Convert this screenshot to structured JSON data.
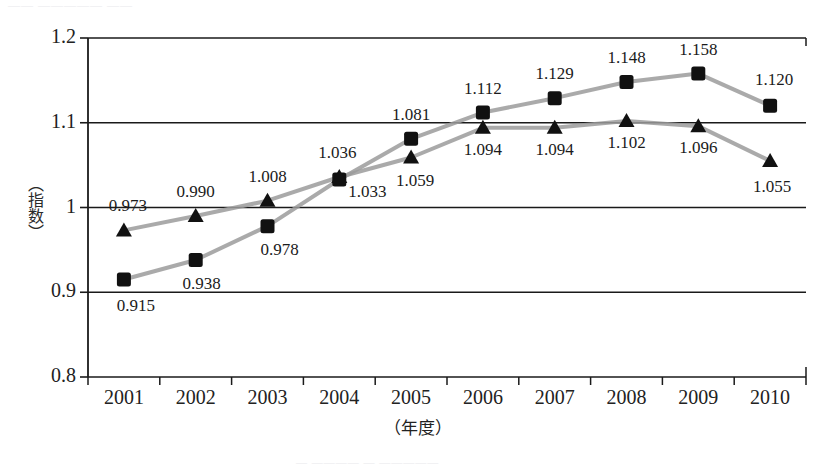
{
  "figure": {
    "scan_top_fragment": "——  —————  ——",
    "scan_bottom_fragment": "— ————  — —————",
    "plot_background": "#ffffff",
    "axis_color": "#1a1a1a",
    "line_color": "#9b9b9b",
    "marker_color": "#111111"
  },
  "chart_data": {
    "type": "line",
    "title": "",
    "xlabel": "（年度）",
    "ylabel": "（指数）",
    "x": [
      "2001",
      "2002",
      "2003",
      "2004",
      "2005",
      "2006",
      "2007",
      "2008",
      "2009",
      "2010"
    ],
    "categories": [
      "2001",
      "2002",
      "2003",
      "2004",
      "2005",
      "2006",
      "2007",
      "2008",
      "2009",
      "2010"
    ],
    "ylim": [
      0.8,
      1.2
    ],
    "yticks": [
      0.8,
      0.9,
      1.0,
      1.1,
      1.2
    ],
    "ytick_labels": [
      "0.8",
      "0.9",
      "1",
      "1.1",
      "1.2"
    ],
    "grid": true,
    "grid_axis": "y",
    "legend": "none",
    "series": [
      {
        "name": "square-series",
        "marker": "square",
        "values": [
          0.915,
          0.938,
          0.978,
          1.033,
          1.081,
          1.112,
          1.129,
          1.148,
          1.158,
          1.12
        ],
        "labels": [
          "0.915",
          "0.938",
          "0.978",
          "1.033",
          "1.081",
          "1.112",
          "1.129",
          "1.148",
          "1.158",
          "1.120"
        ],
        "label_positions": [
          "below",
          "below",
          "below",
          "below",
          "above",
          "above",
          "above",
          "above",
          "above",
          "above"
        ]
      },
      {
        "name": "triangle-series",
        "marker": "triangle",
        "values": [
          0.973,
          0.99,
          1.008,
          1.036,
          1.059,
          1.094,
          1.094,
          1.102,
          1.096,
          1.055
        ],
        "labels": [
          "0.973",
          "0.990",
          "1.008",
          "1.036",
          "1.059",
          "1.094",
          "1.094",
          "1.102",
          "1.096",
          "1.055"
        ],
        "label_positions": [
          "above",
          "above",
          "above",
          "above",
          "below",
          "below",
          "below",
          "below",
          "below",
          "below"
        ]
      }
    ]
  }
}
